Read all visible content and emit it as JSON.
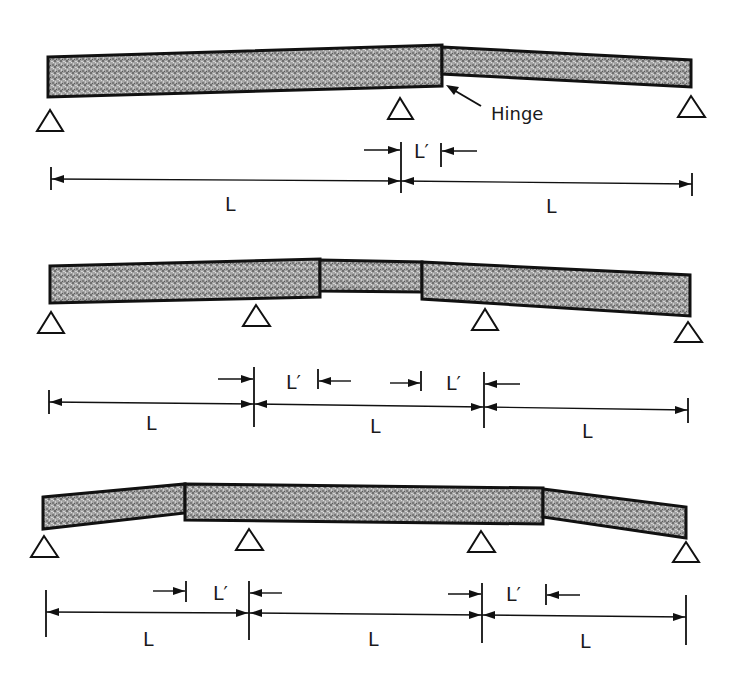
{
  "diagram": {
    "colors": {
      "beam_fill": "#9a9a9a",
      "beam_outline": "#111111",
      "line": "#111111",
      "background": "#ffffff"
    },
    "panels": [
      {
        "id": "two-span-one-hinge",
        "spans": 2,
        "hinges": 1,
        "hinge_label": "Hinge",
        "span_labels": [
          "L",
          "L"
        ],
        "offset_labels": [
          "L′"
        ],
        "supports": 3
      },
      {
        "id": "three-span-two-hinges-center",
        "spans": 3,
        "hinges": 2,
        "span_labels": [
          "L",
          "L",
          "L"
        ],
        "offset_labels": [
          "L′",
          "L′"
        ],
        "supports": 4
      },
      {
        "id": "three-span-two-hinges-outer",
        "spans": 3,
        "hinges": 2,
        "span_labels": [
          "L",
          "L",
          "L"
        ],
        "offset_labels": [
          "L′",
          "L′"
        ],
        "supports": 4
      }
    ]
  }
}
